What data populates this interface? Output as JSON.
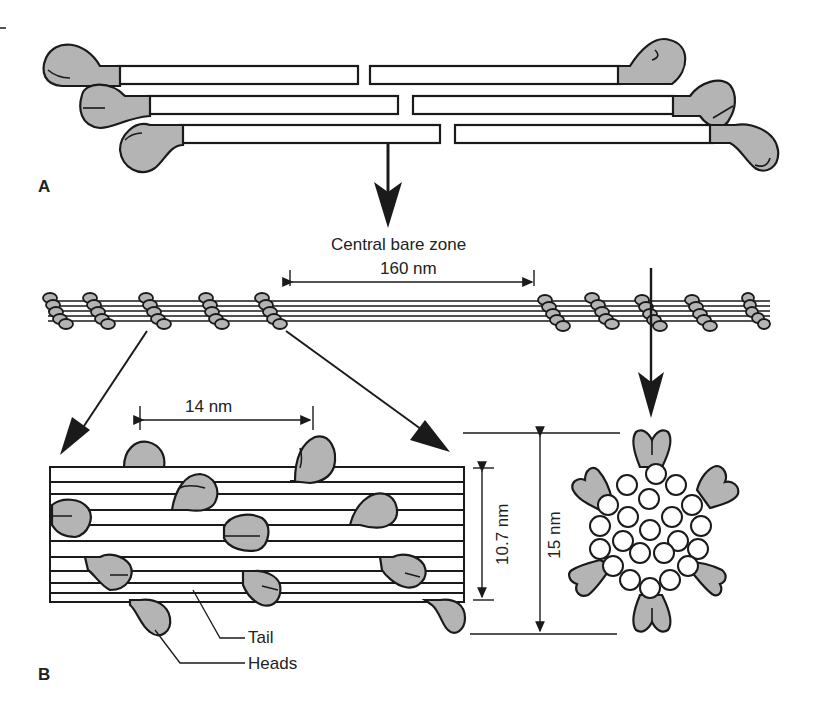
{
  "figure": {
    "colors": {
      "head_fill": "#b4b4b4",
      "stroke": "#1a1a1a",
      "background": "#ffffff"
    }
  },
  "panel_a": {
    "label": "A",
    "description": "Antiparallel myosin molecules with heads at both ends, tails overlapping near center"
  },
  "panel_b": {
    "label": "B",
    "bare_zone_label": "Central bare zone",
    "bare_zone_length": "160 nm",
    "head_spacing": "14 nm",
    "backbone_diameter": "10.7 nm",
    "total_diameter": "15 nm",
    "callouts": {
      "tail": "Tail",
      "heads": "Heads"
    }
  }
}
